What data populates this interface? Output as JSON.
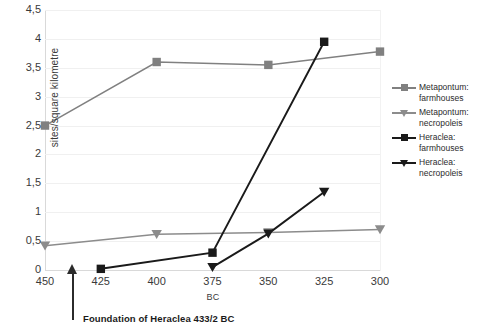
{
  "chart_data": {
    "type": "line",
    "title": "",
    "xlabel": "BC",
    "ylabel": "sites/square kilometre",
    "categories": [
      "450",
      "425",
      "400",
      "375",
      "350",
      "325",
      "300"
    ],
    "ylim": [
      0,
      4.5
    ],
    "ytick_labels": [
      "0",
      "0,5",
      "1",
      "1,5",
      "2",
      "2,5",
      "3",
      "3,5",
      "4",
      "4,5"
    ],
    "ytick_values": [
      0,
      0.5,
      1,
      1.5,
      2,
      2.5,
      3,
      3.5,
      4,
      4.5
    ],
    "grid": true,
    "legend_position": "right",
    "series": [
      {
        "name": "Metapontum: farmhouses",
        "name_line1": "Metapontum:",
        "name_line2": "farmhouses",
        "marker": "square",
        "color": "#808080",
        "values": [
          2.5,
          null,
          3.6,
          null,
          3.55,
          null,
          3.78
        ]
      },
      {
        "name": "Metapontum: necropoleis",
        "name_line1": "Metapontum:",
        "name_line2": "necropoleis",
        "marker": "triangle-down",
        "color": "#8c8c8c",
        "values": [
          0.42,
          null,
          0.62,
          null,
          0.65,
          null,
          0.7
        ]
      },
      {
        "name": "Heraclea: farmhouses",
        "name_line1": "Heraclea:",
        "name_line2": "farmhouses",
        "marker": "square",
        "color": "#1a1a1a",
        "values": [
          null,
          0.02,
          null,
          0.3,
          null,
          3.95,
          null
        ]
      },
      {
        "name": "Heraclea: necropoleis",
        "name_line1": "Heraclea:",
        "name_line2": "necropoleis",
        "marker": "triangle-down",
        "color": "#1a1a1a",
        "values": [
          null,
          null,
          null,
          0.05,
          0.63,
          1.35,
          null
        ]
      }
    ],
    "annotations": [
      {
        "text": "Foundation of Heraclea 433/2 BC",
        "type": "arrow-up",
        "x_category_between": "450-425"
      }
    ]
  }
}
